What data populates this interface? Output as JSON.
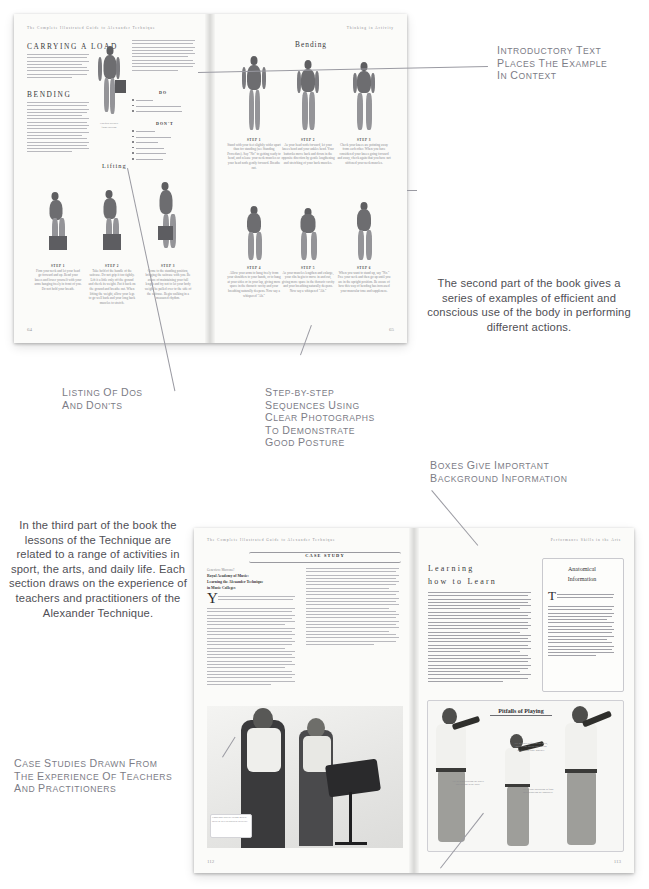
{
  "figure": {
    "background": "#ffffff",
    "annotation_color": "#7c7c86",
    "body_text_color": "#4f4f55"
  },
  "annotations": [
    {
      "id": "intro-text",
      "style": "smallcaps",
      "lines": [
        "Introductory text",
        "places the example",
        "in context"
      ]
    },
    {
      "id": "dos-donts",
      "style": "smallcaps",
      "lines": [
        "Listing of dos",
        "and don'ts"
      ]
    },
    {
      "id": "step-by-step",
      "style": "smallcaps",
      "lines": [
        "Step-by-step",
        "sequences using",
        "clear photographs",
        "to demonstrate",
        "good posture"
      ]
    },
    {
      "id": "boxes-background",
      "style": "smallcaps",
      "lines": [
        "Boxes give important",
        "background information"
      ]
    },
    {
      "id": "case-studies",
      "style": "smallcaps",
      "lines": [
        "Case studies drawn from",
        "the experience of teachers",
        "and practitioners"
      ]
    }
  ],
  "descriptions": {
    "second_part": "The second part of the book gives a series of examples of efficient and conscious use of the body in performing different actions.",
    "third_part": "In the third part of the book the lessons of the Technique are related to a range of activities in sport, the arts, and daily life. Each section draws on the experience of teachers and practitioners of the Alexander Technique."
  },
  "spread_top": {
    "running_head_left": "The Complete Illustrated Guide to Alexander Technique",
    "running_head_right": "Thinking in Activity",
    "page_left": "64",
    "page_right": "65",
    "left_page": {
      "heading_1": "CARRYING A LOAD",
      "heading_2": "BENDING",
      "do_label": "DO",
      "dont_label": "DON'T",
      "lifting_label": "Lifting",
      "do_items": [
        "Breathe out.",
        "Keep the thought of lengthening your muscles.",
        "Let the arms hang freely from your shoulders."
      ],
      "dont_items": [
        "Tighten your neck.",
        "Have your feet too close together.",
        "Think of going down.",
        "Set yourself into a position.",
        "Stiffen the ankles and knees.",
        "Tighten the front muscles."
      ],
      "steps": [
        {
          "label": "STEP 1",
          "caption": "Firm your neck and let your head go forward and up. Bend your knees and lower yourself with your arms hanging freely in front of you. Do not hold your breath."
        },
        {
          "label": "STEP 2",
          "caption": "Take hold of the handle of the suitcase. Do not grip it too tightly. Lift it a little only off the ground and check its weight. Put it back on the ground and breathe out. When lifting the weight, allow your legs to go well back and your long back muscles to stretch."
        },
        {
          "label": "STEP 3",
          "caption": "Come to the standing position, bringing the suitcase with you. Be aware of maintaining your full length and try not to let your body weight be pulled over to the side of the suitcase. Begin walking in a measured rhythm."
        }
      ]
    },
    "right_page": {
      "heading": "Bending",
      "steps": [
        {
          "label": "STEP 1",
          "caption": "Stand with your feet slightly wider apart than for standing (see Standing Procedure). Say \"No\" to getting ready to bend, and release your neck muscles so your head nods gently forward. Breathe out."
        },
        {
          "label": "STEP 2",
          "caption": "As your head nods forward, let your knees bend and your ankles bend. Your buttocks move back and down in the opposite direction by gentle lengthening and stretching of your back muscles."
        },
        {
          "label": "STEP 3",
          "caption": "Check your knees are pointing away from each other. When you have considered your knees going forward and away, check again that you have not stiffened your neck muscles."
        },
        {
          "label": "STEP 4",
          "caption": "Allow your arms to hang freely from your shoulders to your hands, or to hang at your sides or in your lap, giving more space in the thoracic cavity and your breathing naturally deepens. Now say a whispered \"Ah.\""
        },
        {
          "label": "STEP 5",
          "caption": "As your muscles lengthen and enlarge, your ribs begin to move in and out, giving more space in the thoracic cavity and your breathing naturally deepens. Now say a whispered \"Ah.\""
        },
        {
          "label": "STEP 6",
          "caption": "When you want to stand up, say \"No.\" Free your neck and then go up until you are in the upright position. Be aware of how this way of bending has increased your muscular tone and suppleness."
        }
      ]
    }
  },
  "spread_bottom": {
    "running_head_left": "The Complete Illustrated Guide to Alexander Technique",
    "running_head_right": "Performance Skills in the Arts",
    "page_left": "112",
    "page_right": "113",
    "left_page": {
      "banner": "CASE STUDY",
      "byline": "Genevieve Maccone?",
      "institution_1": "Royal Academy of Music:",
      "institution_2": "Learning the Alexander Technique",
      "institution_3": "in Music Colleges",
      "dropcap": "Y",
      "photo_caption": "Conscious practice brings mental skills as well as physical dexterity."
    },
    "right_page": {
      "heading_line_1": "Learning",
      "heading_line_2": "how to Learn",
      "box_title_line_1": "Anatomical",
      "box_title_line_2": "Information",
      "box_dropcap": "T",
      "pitfalls_title": "Pitfalls of Playing",
      "pitfall_captions": [
        "Try to avoid stiffening the neck, holding the breath and having the feet too close together.",
        "Try to stop collapsing in front and narrowing the shoulders.",
        "Try to avoid bracing the knees and pulling in the back."
      ]
    }
  }
}
